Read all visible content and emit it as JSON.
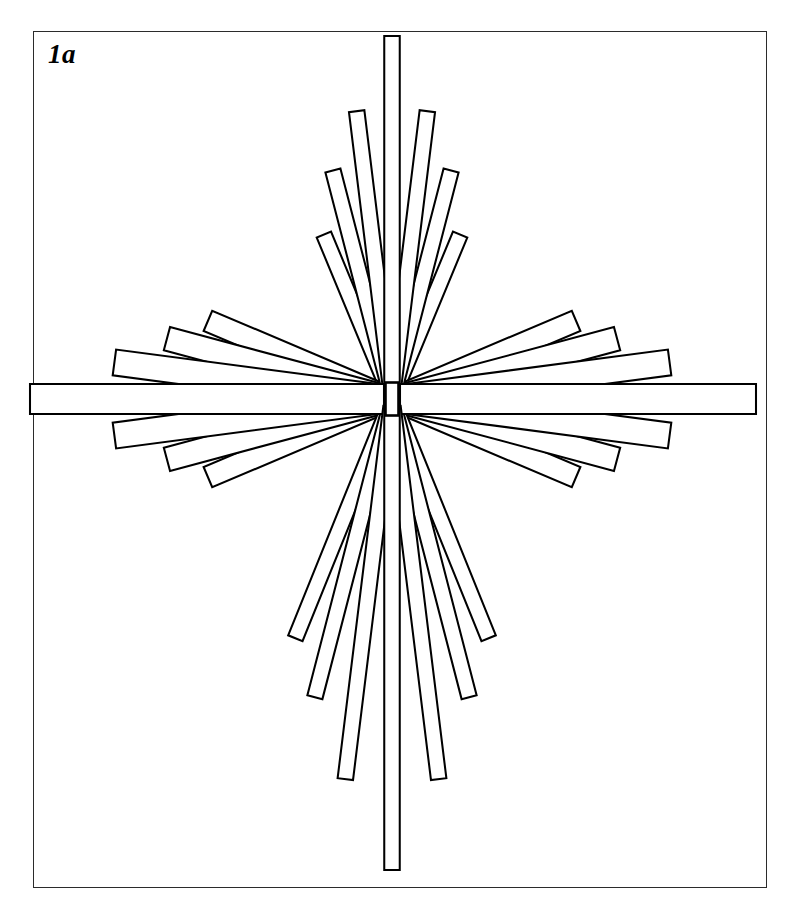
{
  "figure": {
    "label": "1a",
    "caption_label": "1a",
    "background_color": "#ffffff",
    "line_color": "#000000",
    "frame_color": "#2b2b2b",
    "frame": {
      "x": 33,
      "y": 31,
      "width": 734,
      "height": 857
    },
    "canvas": {
      "width": 790,
      "height": 900
    }
  },
  "chart_data": {
    "type": "diagram",
    "subtype": "radial-bar-fan",
    "title": "1a",
    "center": {
      "x": 392,
      "y": 399
    },
    "hub": {
      "x": 385.5,
      "y": 382.5,
      "width": 13,
      "height": 33
    },
    "bar_width": 15,
    "clusters": [
      {
        "name": "top",
        "direction_deg": -90,
        "bars": [
          {
            "angle_deg": -90.0,
            "length": 355,
            "width": 15.5
          },
          {
            "angle_deg": -83.0,
            "length": 282,
            "width": 15.5
          },
          {
            "angle_deg": -97.0,
            "length": 282,
            "width": 15.5
          },
          {
            "angle_deg": -75.5,
            "length": 228,
            "width": 15.5
          },
          {
            "angle_deg": -104.5,
            "length": 228,
            "width": 15.5
          },
          {
            "angle_deg": -67.5,
            "length": 170,
            "width": 15.5
          },
          {
            "angle_deg": -112.5,
            "length": 170,
            "width": 15.5
          }
        ]
      },
      {
        "name": "bottom",
        "direction_deg": 90,
        "bars": [
          {
            "angle_deg": 90.0,
            "length": 463,
            "width": 15.5
          },
          {
            "angle_deg": 83.0,
            "length": 375,
            "width": 15.5
          },
          {
            "angle_deg": 97.0,
            "length": 375,
            "width": 15.5
          },
          {
            "angle_deg": 75.5,
            "length": 300,
            "width": 15.5
          },
          {
            "angle_deg": 104.5,
            "length": 300,
            "width": 15.5
          },
          {
            "angle_deg": 68.0,
            "length": 250,
            "width": 15.5
          },
          {
            "angle_deg": 112.0,
            "length": 250,
            "width": 15.5
          }
        ]
      },
      {
        "name": "left",
        "direction_deg": 180,
        "bars": [
          {
            "angle_deg": 180.0,
            "length": 354,
            "width": 30
          },
          {
            "angle_deg": 172.5,
            "length": 272,
            "width": 26
          },
          {
            "angle_deg": -172.5,
            "length": 272,
            "width": 26
          },
          {
            "angle_deg": 165.0,
            "length": 225,
            "width": 24
          },
          {
            "angle_deg": -165.0,
            "length": 225,
            "width": 24
          },
          {
            "angle_deg": 157.0,
            "length": 192,
            "width": 22
          },
          {
            "angle_deg": -157.0,
            "length": 192,
            "width": 22
          }
        ]
      },
      {
        "name": "right",
        "direction_deg": 0,
        "bars": [
          {
            "angle_deg": 0.0,
            "length": 356,
            "width": 30
          },
          {
            "angle_deg": 7.5,
            "length": 272,
            "width": 26
          },
          {
            "angle_deg": -7.5,
            "length": 272,
            "width": 26
          },
          {
            "angle_deg": 15.0,
            "length": 225,
            "width": 24
          },
          {
            "angle_deg": -15.0,
            "length": 225,
            "width": 24
          },
          {
            "angle_deg": 23.0,
            "length": 192,
            "width": 22
          },
          {
            "angle_deg": -23.0,
            "length": 192,
            "width": 22
          }
        ]
      }
    ]
  }
}
